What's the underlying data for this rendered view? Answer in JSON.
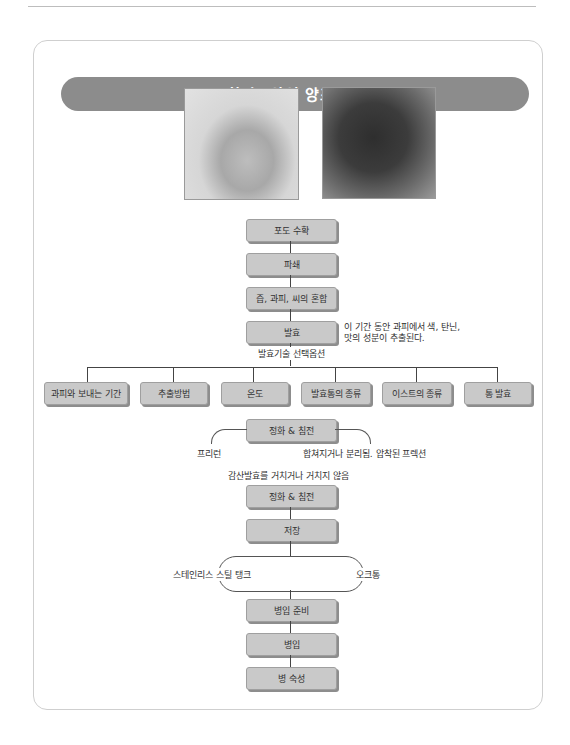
{
  "title": "화이트와인 양조과정",
  "images": [
    {
      "name": "white-grapes",
      "alt": "청포도"
    },
    {
      "name": "red-grapes",
      "alt": "적포도"
    }
  ],
  "main_steps": [
    "포도 수확",
    "파쇄",
    "즙, 과피, 씨의 혼합",
    "발효"
  ],
  "fermentation_note": {
    "line1": "이 기간 동안 과피에서 색, 탄닌,",
    "line2": "맛의 성분이 추출된다."
  },
  "options_label": "발효기술 선택옵션",
  "options": [
    "과피와 보내는 기간",
    "추출방법",
    "온도",
    "발효통의 종류",
    "이스트의 종류",
    "통 발효"
  ],
  "clarify1": "정화 & 침전",
  "press_left": "프리런",
  "press_right": "합쳐지거나 분리됨. 압착된 프렉션",
  "malolactic": "감산발효를 거치거나 거치지 않음",
  "clarify2": "정화 & 침전",
  "storage": "저장",
  "storage_left": "스테인리스 스틸 탱크",
  "storage_right": "오크통",
  "final_steps": [
    "병입 준비",
    "병입",
    "병 숙성"
  ]
}
